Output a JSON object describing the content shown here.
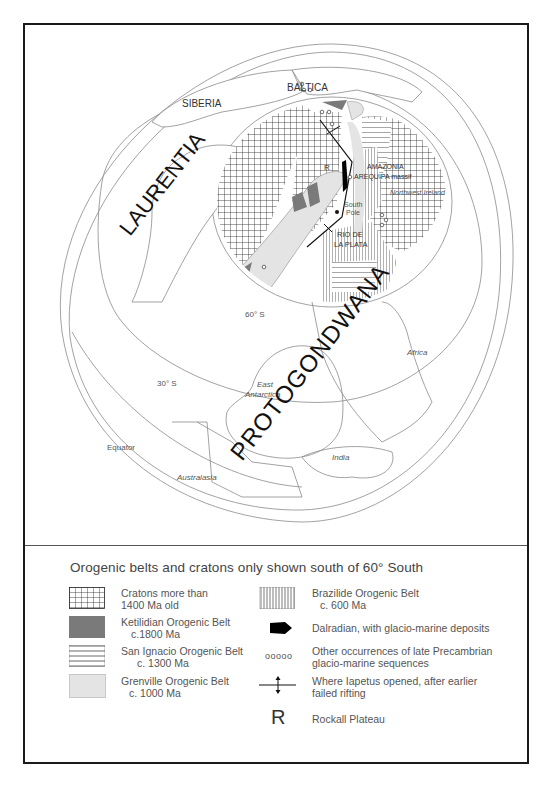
{
  "map": {
    "labels": {
      "siberia": "SIBERIA",
      "baltica": "BALTICA",
      "laurentia": "LAURENTIA",
      "protogondwana": "PROTOGONDWANA",
      "amazonia": "AMAZONIA",
      "arequipa": "AREQUIPA massif",
      "northwest_ireland": "Northwest Ireland",
      "south_pole_1": "South",
      "south_pole_2": "Pole",
      "rio_de_la_plata_1": "RIO DE",
      "rio_de_la_plata_2": "LA PLATA",
      "rockall": "R",
      "lat_60": "60° S",
      "lat_30": "30° S",
      "equator": "Equator",
      "east_antarctica_1": "East",
      "east_antarctica_2": "Antarctica",
      "africa": "Africa",
      "india": "India",
      "australasia": "Australasia"
    },
    "colors": {
      "line": "#8a8a8a",
      "craton_hatch": "#222222",
      "ketilidian": "#7a7a7a",
      "grenville": "#e4e4e4",
      "dalradian": "#000000"
    }
  },
  "legend": {
    "title": "Orogenic belts and cratons only shown south of 60° South",
    "items": [
      {
        "id": "cratons",
        "line1": "Cratons more than",
        "line2": "1400 Ma old"
      },
      {
        "id": "ketilidian",
        "line1": "Ketilidian Orogenic Belt",
        "line2": "c.1800 Ma"
      },
      {
        "id": "san-ignacio",
        "line1": "San Ignacio Orogenic Belt",
        "line2": "c. 1300 Ma"
      },
      {
        "id": "grenville",
        "line1": "Grenville Orogenic Belt",
        "line2": "c. 1000 Ma"
      },
      {
        "id": "brazilide",
        "line1": "Brazilide Orogenic Belt",
        "line2": "c. 600 Ma"
      },
      {
        "id": "dalradian",
        "line1": "Dalradian, with glacio-marine deposits",
        "line2": ""
      },
      {
        "id": "precambrian",
        "line1": "Other occurrences of late Precambrian",
        "line2": "glacio-marine sequences",
        "symbol": "ooooo"
      },
      {
        "id": "iapetus",
        "line1": "Where Iapetus opened, after earlier",
        "line2": "failed rifting"
      },
      {
        "id": "rockall",
        "line1": "Rockall Plateau",
        "line2": "",
        "symbol": "R"
      }
    ]
  }
}
